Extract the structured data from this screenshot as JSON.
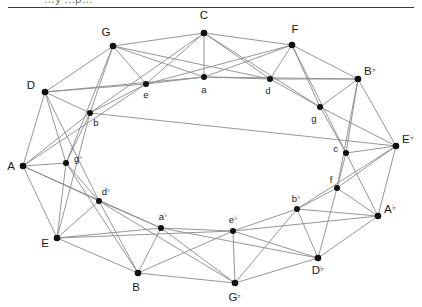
{
  "page": {
    "background_color": "#ffffff",
    "clipped_caption": "…y …p…",
    "rule_color": "#3a3a3a"
  },
  "graph": {
    "edge_color": "#8a8a8a",
    "node_color": "#111111",
    "label_color": "#1a1a1a",
    "node_count": 24,
    "edge_count": 72,
    "nodes": [
      {
        "id": "C",
        "label": "C",
        "accidental": "",
        "ring": "outer",
        "x": 204,
        "y": 33,
        "lx": 204,
        "ly": 19,
        "anchor": "middle"
      },
      {
        "id": "G",
        "label": "G",
        "accidental": "",
        "ring": "outer",
        "x": 113,
        "y": 46,
        "lx": 106,
        "ly": 36,
        "anchor": "middle"
      },
      {
        "id": "F",
        "label": "F",
        "accidental": "",
        "ring": "outer",
        "x": 292,
        "y": 45,
        "lx": 295,
        "ly": 33,
        "anchor": "middle"
      },
      {
        "id": "D",
        "label": "D",
        "accidental": "",
        "ring": "outer",
        "x": 45,
        "y": 92,
        "lx": 35,
        "ly": 89,
        "anchor": "end"
      },
      {
        "id": "Bb",
        "label": "B",
        "accidental": "♭",
        "ring": "outer",
        "x": 358,
        "y": 79,
        "lx": 364,
        "ly": 75,
        "anchor": "start"
      },
      {
        "id": "A",
        "label": "A",
        "accidental": "",
        "ring": "outer",
        "x": 23,
        "y": 166,
        "lx": 15,
        "ly": 170,
        "anchor": "end"
      },
      {
        "id": "Eb",
        "label": "E",
        "accidental": "♭",
        "ring": "outer",
        "x": 396,
        "y": 146,
        "lx": 402,
        "ly": 143,
        "anchor": "start"
      },
      {
        "id": "E",
        "label": "E",
        "accidental": "",
        "ring": "outer",
        "x": 57,
        "y": 238,
        "lx": 49,
        "ly": 247,
        "anchor": "end"
      },
      {
        "id": "Ab",
        "label": "A",
        "accidental": "♭",
        "ring": "outer",
        "x": 378,
        "y": 216,
        "lx": 384,
        "ly": 213,
        "anchor": "start"
      },
      {
        "id": "B",
        "label": "B",
        "accidental": "",
        "ring": "outer",
        "x": 138,
        "y": 273,
        "lx": 136,
        "ly": 291,
        "anchor": "middle"
      },
      {
        "id": "Db",
        "label": "D",
        "accidental": "♭",
        "ring": "outer",
        "x": 318,
        "y": 258,
        "lx": 318,
        "ly": 274,
        "anchor": "middle"
      },
      {
        "id": "Gb",
        "label": "G",
        "accidental": "♭",
        "ring": "outer",
        "x": 235,
        "y": 283,
        "lx": 235,
        "ly": 301,
        "anchor": "middle"
      },
      {
        "id": "a",
        "label": "a",
        "accidental": "",
        "ring": "inner",
        "x": 204,
        "y": 77,
        "lx": 204,
        "ly": 93,
        "anchor": "middle"
      },
      {
        "id": "e",
        "label": "e",
        "accidental": "",
        "ring": "inner",
        "x": 146,
        "y": 84,
        "lx": 146,
        "ly": 98,
        "anchor": "middle"
      },
      {
        "id": "d",
        "label": "d",
        "accidental": "",
        "ring": "inner",
        "x": 270,
        "y": 79,
        "lx": 268,
        "ly": 94,
        "anchor": "middle"
      },
      {
        "id": "b",
        "label": "b",
        "accidental": "",
        "ring": "inner",
        "x": 90,
        "y": 113,
        "lx": 96,
        "ly": 126,
        "anchor": "middle"
      },
      {
        "id": "g",
        "label": "g",
        "accidental": "",
        "ring": "inner",
        "x": 320,
        "y": 107,
        "lx": 314,
        "ly": 122,
        "anchor": "middle"
      },
      {
        "id": "gb",
        "label": "g",
        "accidental": "♭",
        "ring": "inner",
        "x": 66,
        "y": 163,
        "lx": 74,
        "ly": 162,
        "anchor": "start"
      },
      {
        "id": "c",
        "label": "c",
        "accidental": "",
        "ring": "inner",
        "x": 346,
        "y": 153,
        "lx": 338,
        "ly": 152,
        "anchor": "end"
      },
      {
        "id": "db",
        "label": "d",
        "accidental": "♭",
        "ring": "inner",
        "x": 99,
        "y": 201,
        "lx": 106,
        "ly": 195,
        "anchor": "middle"
      },
      {
        "id": "f",
        "label": "f",
        "accidental": "",
        "ring": "inner",
        "x": 337,
        "y": 188,
        "lx": 331,
        "ly": 183,
        "anchor": "middle"
      },
      {
        "id": "ab",
        "label": "a",
        "accidental": "♭",
        "ring": "inner",
        "x": 161,
        "y": 228,
        "lx": 163,
        "ly": 220,
        "anchor": "middle"
      },
      {
        "id": "bb",
        "label": "b",
        "accidental": "♭",
        "ring": "inner",
        "x": 297,
        "y": 209,
        "lx": 296,
        "ly": 202,
        "anchor": "middle"
      },
      {
        "id": "eb",
        "label": "e",
        "accidental": "♭",
        "ring": "inner",
        "x": 233,
        "y": 231,
        "lx": 233,
        "ly": 223,
        "anchor": "middle"
      }
    ],
    "edges": [
      [
        "C",
        "G"
      ],
      [
        "C",
        "F"
      ],
      [
        "C",
        "e"
      ],
      [
        "C",
        "a"
      ],
      [
        "C",
        "d"
      ],
      [
        "C",
        "b"
      ],
      [
        "C",
        "g"
      ],
      [
        "G",
        "D"
      ],
      [
        "G",
        "e"
      ],
      [
        "G",
        "a"
      ],
      [
        "G",
        "b"
      ],
      [
        "G",
        "d"
      ],
      [
        "G",
        "gb"
      ],
      [
        "F",
        "Bb"
      ],
      [
        "F",
        "a"
      ],
      [
        "F",
        "d"
      ],
      [
        "F",
        "g"
      ],
      [
        "F",
        "e"
      ],
      [
        "F",
        "c"
      ],
      [
        "D",
        "A"
      ],
      [
        "D",
        "b"
      ],
      [
        "D",
        "e"
      ],
      [
        "D",
        "gb"
      ],
      [
        "D",
        "a"
      ],
      [
        "D",
        "db"
      ],
      [
        "Bb",
        "Eb"
      ],
      [
        "Bb",
        "g"
      ],
      [
        "Bb",
        "d"
      ],
      [
        "Bb",
        "c"
      ],
      [
        "Bb",
        "f"
      ],
      [
        "Bb",
        "a"
      ],
      [
        "A",
        "E"
      ],
      [
        "A",
        "gb"
      ],
      [
        "A",
        "b"
      ],
      [
        "A",
        "db"
      ],
      [
        "A",
        "e"
      ],
      [
        "A",
        "ab"
      ],
      [
        "Eb",
        "Ab"
      ],
      [
        "Eb",
        "c"
      ],
      [
        "Eb",
        "g"
      ],
      [
        "Eb",
        "f"
      ],
      [
        "Eb",
        "bb"
      ],
      [
        "Eb",
        "b"
      ],
      [
        "E",
        "B"
      ],
      [
        "E",
        "db"
      ],
      [
        "E",
        "gb"
      ],
      [
        "E",
        "ab"
      ],
      [
        "E",
        "b"
      ],
      [
        "E",
        "eb"
      ],
      [
        "Ab",
        "Db"
      ],
      [
        "Ab",
        "f"
      ],
      [
        "Ab",
        "c"
      ],
      [
        "Ab",
        "bb"
      ],
      [
        "Ab",
        "eb"
      ],
      [
        "B",
        "Gb"
      ],
      [
        "B",
        "ab"
      ],
      [
        "B",
        "db"
      ],
      [
        "B",
        "eb"
      ],
      [
        "B",
        "gb"
      ],
      [
        "Db",
        "Gb"
      ],
      [
        "Db",
        "bb"
      ],
      [
        "Db",
        "f"
      ],
      [
        "Db",
        "eb"
      ],
      [
        "Db",
        "ab"
      ],
      [
        "Gb",
        "eb"
      ],
      [
        "Gb",
        "ab"
      ],
      [
        "Gb",
        "bb"
      ],
      [
        "Gb",
        "db"
      ],
      [
        "e",
        "a"
      ],
      [
        "a",
        "d"
      ],
      [
        "d",
        "g"
      ],
      [
        "g",
        "c"
      ],
      [
        "c",
        "f"
      ],
      [
        "f",
        "bb"
      ],
      [
        "bb",
        "eb"
      ],
      [
        "eb",
        "ab"
      ],
      [
        "ab",
        "db"
      ],
      [
        "db",
        "gb"
      ],
      [
        "gb",
        "b"
      ],
      [
        "b",
        "e"
      ]
    ]
  }
}
